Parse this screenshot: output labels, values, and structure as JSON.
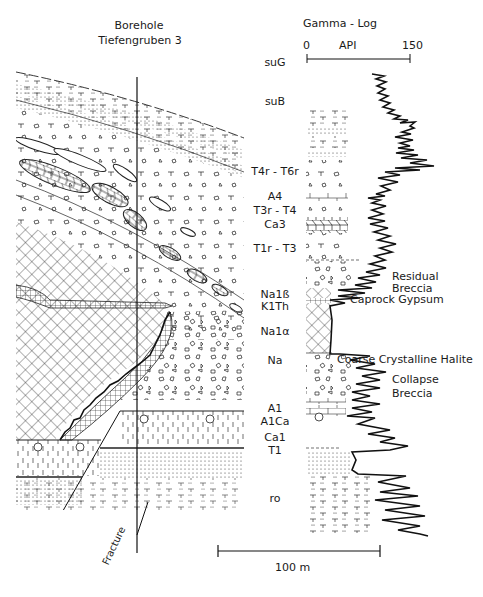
{
  "headers": {
    "borehole_line1": "Borehole",
    "borehole_line2": "Tiefengruben 3",
    "gamma_log": "Gamma - Log"
  },
  "gamma_axis": {
    "min_label": "0",
    "unit_label": "API",
    "max_label": "150"
  },
  "strata_labels": [
    {
      "id": "suG",
      "text": "suG",
      "y": 62
    },
    {
      "id": "suB",
      "text": "suB",
      "y": 106
    },
    {
      "id": "T4r-T6r",
      "text": "T4r - T6r",
      "y": 173
    },
    {
      "id": "A4",
      "text": "A4",
      "y": 195
    },
    {
      "id": "T3r-T4",
      "text": "T3r - T4",
      "y": 209
    },
    {
      "id": "Ca3",
      "text": "Ca3",
      "y": 223
    },
    {
      "id": "T1r-T3",
      "text": "T1r - T3",
      "y": 247
    },
    {
      "id": "Na1b",
      "text": "Na1ß",
      "y": 289
    },
    {
      "id": "K1Th",
      "text": "K1Th",
      "y": 302
    },
    {
      "id": "Na1a",
      "text": "Na1α",
      "y": 329
    },
    {
      "id": "Na",
      "text": "Na",
      "y": 359
    },
    {
      "id": "A1",
      "text": "A1",
      "y": 405
    },
    {
      "id": "A1Ca",
      "text": "A1Ca",
      "y": 418
    },
    {
      "id": "Ca1",
      "text": "Ca1",
      "y": 435
    },
    {
      "id": "T1",
      "text": "T1",
      "y": 449
    },
    {
      "id": "ro",
      "text": "ro",
      "y": 494
    }
  ],
  "annotations": {
    "residual_breccia_1": "Residual",
    "residual_breccia_2": "Breccia",
    "caprock_gypsum": "Caprock Gypsum",
    "coarse_crystalline_halite": "Coarse Crystalline Halite",
    "collapse_breccia_1": "Collapse",
    "collapse_breccia_2": "Breccia",
    "fracture": "Fracture"
  },
  "scale_bar": {
    "label": "100 m"
  },
  "colors": {
    "ink": "#1a1a1a",
    "background": "#ffffff"
  }
}
